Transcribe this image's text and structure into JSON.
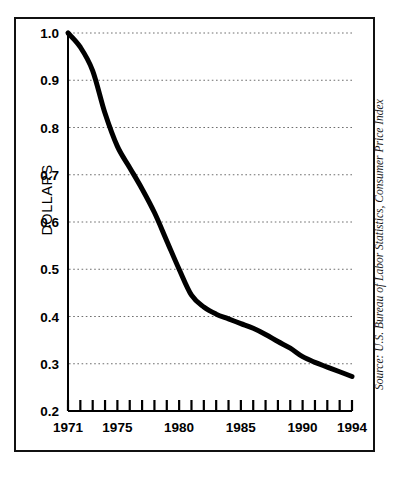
{
  "figure": {
    "y_axis_title": "DOLLARS",
    "source_note": "Source: U.S. Bureau of Labor Statistics, Consumer Price Index"
  },
  "chart_data": {
    "type": "line",
    "title": "",
    "subtitle": "",
    "xlabel": "",
    "ylabel": "DOLLARS",
    "xlim": [
      1971,
      1994
    ],
    "ylim": [
      0.2,
      1.0
    ],
    "grid": "horizontal-dotted",
    "legend": "none",
    "line_color": "#000000",
    "line_width_px": 5,
    "y_ticks": [
      0.2,
      0.3,
      0.4,
      0.5,
      0.6,
      0.7,
      0.8,
      0.9,
      1.0
    ],
    "y_tick_labels": [
      "0.2",
      "0.3",
      "0.4",
      "0.5",
      "0.6",
      "0.7",
      "0.8",
      "0.9",
      "1.0"
    ],
    "x_ticks": [
      1971,
      1972,
      1973,
      1974,
      1975,
      1976,
      1977,
      1978,
      1979,
      1980,
      1981,
      1982,
      1983,
      1984,
      1985,
      1986,
      1987,
      1988,
      1989,
      1990,
      1991,
      1992,
      1993,
      1994
    ],
    "x_tick_labels_shown": [
      "1971",
      "1975",
      "1980",
      "1985",
      "1990",
      "1994"
    ],
    "x_labeled_years": [
      1971,
      1975,
      1980,
      1985,
      1990,
      1994
    ],
    "x": [
      1971,
      1972,
      1973,
      1974,
      1975,
      1976,
      1977,
      1978,
      1979,
      1980,
      1981,
      1982,
      1983,
      1984,
      1985,
      1986,
      1987,
      1988,
      1989,
      1990,
      1991,
      1992,
      1993,
      1994
    ],
    "values": [
      1.0,
      0.97,
      0.92,
      0.83,
      0.76,
      0.715,
      0.67,
      0.62,
      0.56,
      0.5,
      0.445,
      0.42,
      0.405,
      0.395,
      0.385,
      0.375,
      0.362,
      0.347,
      0.333,
      0.315,
      0.303,
      0.293,
      0.283,
      0.273
    ],
    "annotations": []
  }
}
